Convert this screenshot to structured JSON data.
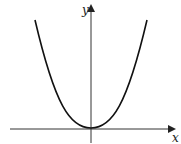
{
  "diagram": {
    "type": "function-graph",
    "curve": "parabola",
    "vertex": "origin",
    "axes": {
      "x_label": "x",
      "y_label": "y"
    },
    "colors": {
      "curve": "#111111",
      "axis": "#333333",
      "background": "#ffffff"
    }
  }
}
